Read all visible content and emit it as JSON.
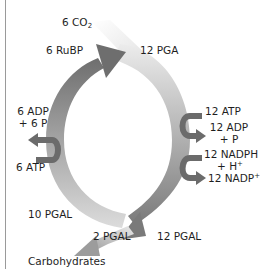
{
  "diagram": {
    "colors": {
      "arc_dark": "#6e6e6e",
      "arc_light": "#e6e6e6",
      "side_arrow": "#6b6b6b",
      "rule": "#9a9a9a"
    },
    "labels": {
      "co2": "6 CO",
      "co2_sub": "2",
      "rubp": "6 RuBP",
      "pga": "12 PGA",
      "adp6_line1": "6 ADP",
      "adp6_line2": "+ 6 P",
      "atp6": "6 ATP",
      "atp12": "12 ATP",
      "adp12_line1": "12 ADP",
      "adp12_line2": "+ P",
      "nadph_line1": "12 NADPH",
      "nadph_line2": "+ H",
      "nadph_sup": "+",
      "nadp": "12 NADP",
      "nadp_sup": "+",
      "pgal10": "10 PGAL",
      "pgal2": "2 PGAL",
      "pgal12": "12 PGAL",
      "carbohydrates": "Carbohydrates"
    }
  }
}
